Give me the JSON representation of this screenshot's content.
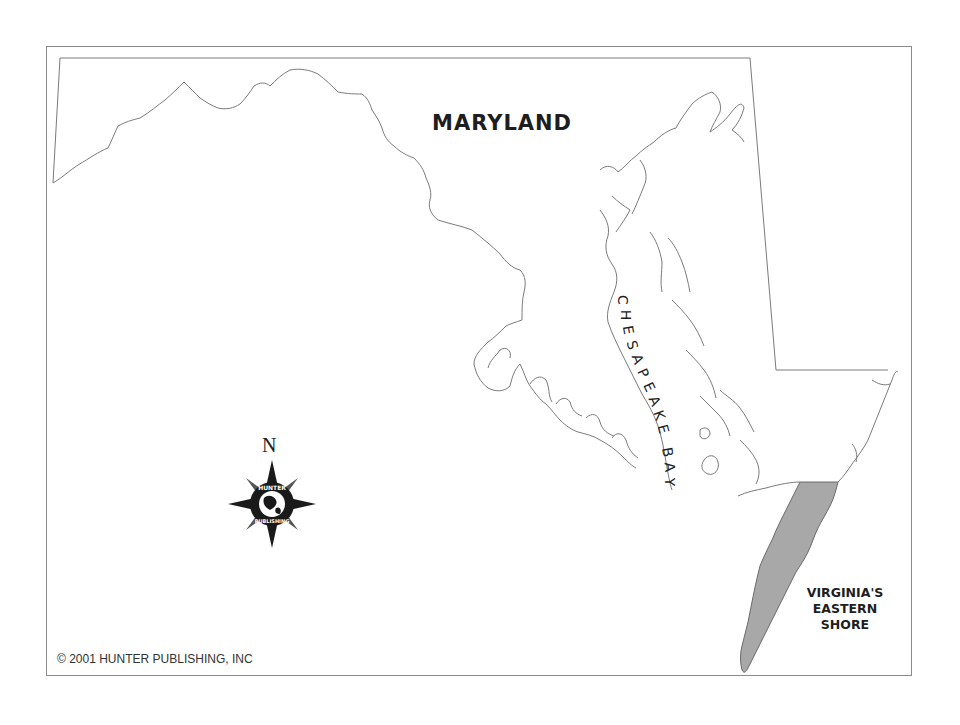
{
  "map": {
    "title": "MARYLAND",
    "water_label": "CHESAPEAKE BAY",
    "water_label_letters": [
      "C",
      "H",
      "E",
      "S",
      "A",
      "P",
      "E",
      "A",
      "K",
      "E",
      " ",
      "B",
      "A",
      "Y"
    ],
    "highlighted_region": {
      "label_lines": [
        "VIRGINIA'S",
        "EASTERN",
        "SHORE"
      ],
      "fill_color": "#a8a8a8"
    },
    "compass": {
      "north_label": "N",
      "logo_top_text": "HUNTER",
      "logo_bottom_text": "PUBLISHING"
    },
    "copyright": "© 2001 HUNTER PUBLISHING, INC",
    "colors": {
      "outline": "#7a7a7a",
      "frame": "#8a8a8a",
      "background": "#ffffff",
      "text": "#1e1e1e"
    }
  }
}
